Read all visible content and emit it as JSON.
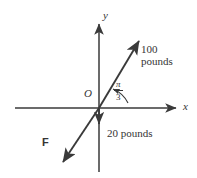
{
  "figure": {
    "axes": {
      "x_label": "x",
      "y_label": "y",
      "origin_label": "O"
    },
    "angle": {
      "numerator": "π",
      "denominator": "3",
      "value_radians": 1.0472,
      "value_degrees": 60
    },
    "vectors": [
      {
        "name": "resultant-vector",
        "magnitude_label_line1": "100",
        "magnitude_label_line2": "pounds",
        "direction": "up-right"
      },
      {
        "name": "weight-vector",
        "magnitude_label": "20 pounds",
        "direction": "down"
      },
      {
        "name": "force-vector",
        "symbol_label": "F",
        "direction": "down-left"
      }
    ],
    "colors": {
      "stroke": "#3a3a3a",
      "text": "#343434",
      "background": "#ffffff"
    }
  }
}
